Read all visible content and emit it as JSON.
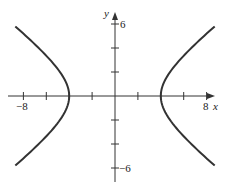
{
  "chart_data": {
    "type": "line",
    "title": "",
    "xlabel": "x",
    "ylabel": "y",
    "xlim": [
      -8.5,
      9
    ],
    "ylim": [
      -6.5,
      6.5
    ],
    "x_ticks": [
      -8,
      -6,
      -4,
      -2,
      0,
      2,
      4,
      6,
      8
    ],
    "y_ticks": [
      -6,
      -4,
      -2,
      0,
      2,
      4,
      6
    ],
    "x_tick_labels": {
      "-8": "−8",
      "8": "8"
    },
    "y_tick_labels": {
      "6": "6",
      "-6": "−6"
    },
    "grid": false,
    "legend": null,
    "series": [
      {
        "name": "hyperbola x^2/16 - y^2/9 = 1",
        "equation": "x^2/16 - y^2/9 = 1",
        "branches": [
          {
            "side": "left",
            "vertex": [
              -4,
              0
            ],
            "y_range": [
              -5.8,
              5.8
            ]
          },
          {
            "side": "right",
            "vertex": [
              4,
              0
            ],
            "y_range": [
              -5.8,
              5.8
            ]
          }
        ]
      }
    ],
    "colors": {
      "curve": "#333333",
      "axes": "#333333"
    }
  },
  "labels": {
    "x_axis": "x",
    "y_axis": "y",
    "x_min_tick": "−8",
    "x_max_tick": "8",
    "y_max_tick": "6",
    "y_min_tick": "−6"
  }
}
